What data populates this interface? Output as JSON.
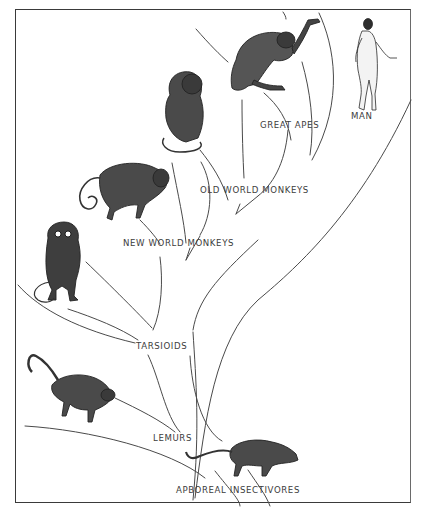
{
  "diagram": {
    "type": "phylogenetic-tree",
    "colors": {
      "ink": "#2a2a2a",
      "line": "#4a4a4a",
      "background": "#ffffff",
      "label": "#3c3c3c"
    }
  },
  "labels": {
    "man": "MAN",
    "great_apes": "GREAT APES",
    "old_world_monkeys": "OLD WORLD MONKEYS",
    "new_world_monkeys": "NEW WORLD MONKEYS",
    "tarsioids": "TARSIOIDS",
    "lemurs": "LEMURS",
    "arboreal_insectivores": "APBOREAL INSECTIVORES"
  },
  "illustrations": [
    {
      "id": "man",
      "icon": "human-figure-icon"
    },
    {
      "id": "great-ape",
      "icon": "ape-figure-icon"
    },
    {
      "id": "old-world-monkey",
      "icon": "sitting-monkey-icon"
    },
    {
      "id": "new-world-monkey",
      "icon": "curled-tail-monkey-icon"
    },
    {
      "id": "tarsier",
      "icon": "tarsier-icon"
    },
    {
      "id": "lemur",
      "icon": "lemur-icon"
    },
    {
      "id": "tree-shrew",
      "icon": "tree-shrew-icon"
    }
  ]
}
